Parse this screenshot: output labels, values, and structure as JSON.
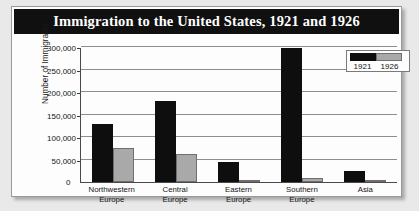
{
  "chart_data": {
    "type": "bar",
    "title": "Immigration to the United States, 1921 and 1926",
    "xlabel": "",
    "ylabel": "Number of Immigrants",
    "categories": [
      "Northwestern Europe",
      "Central Europe",
      "Eastern Europe",
      "Southern Europe",
      "Asia"
    ],
    "series": [
      {
        "name": "1921",
        "color": "#0e0e0e",
        "values": [
          128000,
          180000,
          45000,
          297000,
          25000
        ]
      },
      {
        "name": "1926",
        "color": "#a9a9a9",
        "values": [
          76000,
          62000,
          2000,
          9000,
          3000
        ]
      }
    ],
    "ylim": [
      0,
      300000
    ],
    "ytick_values": [
      0,
      50000,
      100000,
      150000,
      200000,
      250000,
      300000
    ],
    "ytick_labels": [
      "0",
      "50,000",
      "100,000",
      "150,000",
      "200,000",
      "250,000",
      "300,000"
    ],
    "grid": true,
    "legend_position": "top-right",
    "legend_entries": [
      "1921",
      "1926"
    ]
  }
}
